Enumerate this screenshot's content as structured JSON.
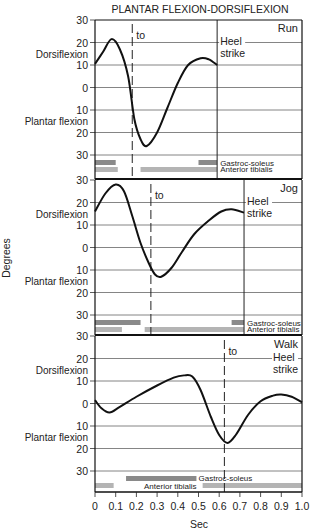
{
  "chart_data": {
    "type": "line",
    "title": "PLANTAR FLEXION-DORSIFLEXION",
    "xlabel": "Sec",
    "ylabel": "Degrees",
    "xlim": [
      0,
      1.0
    ],
    "xticks": [
      "0",
      "0.1",
      "0.2",
      "0.3",
      "0.4",
      "0.5",
      "0.6",
      "0.7",
      "0.8",
      "0.9",
      "1.0"
    ],
    "yticks": [
      "30",
      "20",
      "10",
      "0",
      "10",
      "20",
      "30"
    ],
    "ylim": [
      -30,
      30
    ],
    "upper_label": "Dorsiflexion",
    "lower_label": "Plantar flexion",
    "grid": true,
    "panels": [
      {
        "name": "Run",
        "toe_off_label": "to",
        "toe_off_x": 0.18,
        "heel_strike_label": [
          "Heel",
          "strike"
        ],
        "heel_strike_x": 0.59,
        "series": {
          "x": [
            0,
            0.04,
            0.08,
            0.12,
            0.16,
            0.19,
            0.22,
            0.25,
            0.3,
            0.35,
            0.4,
            0.45,
            0.51,
            0.55,
            0.59
          ],
          "y": [
            10.5,
            16,
            21.5,
            17,
            5,
            -14,
            -23,
            -26,
            -20,
            -9,
            2,
            10,
            13,
            12.5,
            10
          ]
        },
        "muscles": [
          {
            "name": "Gastroc-soleus",
            "intervals": [
              [
                0,
                0.1
              ],
              [
                0.5,
                0.59
              ]
            ]
          },
          {
            "name": "Anterior tibialis",
            "intervals": [
              [
                0,
                0.11
              ],
              [
                0.22,
                0.59
              ]
            ]
          }
        ]
      },
      {
        "name": "Jog",
        "toe_off_label": "to",
        "toe_off_x": 0.27,
        "heel_strike_label": [
          "Heel",
          "strike"
        ],
        "heel_strike_x": 0.72,
        "series": {
          "x": [
            0,
            0.05,
            0.1,
            0.14,
            0.18,
            0.22,
            0.26,
            0.29,
            0.32,
            0.37,
            0.42,
            0.48,
            0.55,
            0.61,
            0.66,
            0.72
          ],
          "y": [
            16,
            24,
            28,
            25,
            14,
            2,
            -7,
            -12,
            -13,
            -9,
            -2,
            6,
            12,
            16,
            17,
            15.5
          ]
        },
        "muscles": [
          {
            "name": "Gastroc-soleus",
            "intervals": [
              [
                0,
                0.22
              ],
              [
                0.66,
                0.72
              ]
            ]
          },
          {
            "name": "Anterior tibialis",
            "intervals": [
              [
                0,
                0.13
              ],
              [
                0.24,
                0.72
              ]
            ]
          }
        ]
      },
      {
        "name": "Walk",
        "toe_off_label": "to",
        "toe_off_x": 0.625,
        "heel_strike_label": [
          "Heel",
          "strike"
        ],
        "heel_strike_x": 1.0,
        "series": {
          "x": [
            0,
            0.03,
            0.07,
            0.12,
            0.2,
            0.3,
            0.38,
            0.43,
            0.47,
            0.51,
            0.56,
            0.6,
            0.64,
            0.68,
            0.74,
            0.8,
            0.86,
            0.9,
            0.95,
            1.0
          ],
          "y": [
            1.5,
            -2,
            -4,
            -1.5,
            3,
            8,
            11.5,
            12.5,
            12,
            6,
            -6,
            -14,
            -17.5,
            -14,
            -5,
            1,
            3.5,
            4,
            3,
            0.5
          ]
        },
        "muscles": [
          {
            "name": "Gastroc-soleus",
            "intervals": [
              [
                0.15,
                0.49
              ]
            ]
          },
          {
            "name": "Anterior tibialis",
            "intervals": [
              [
                0,
                0.09
              ],
              [
                0.52,
                1.0
              ]
            ]
          }
        ]
      }
    ]
  }
}
